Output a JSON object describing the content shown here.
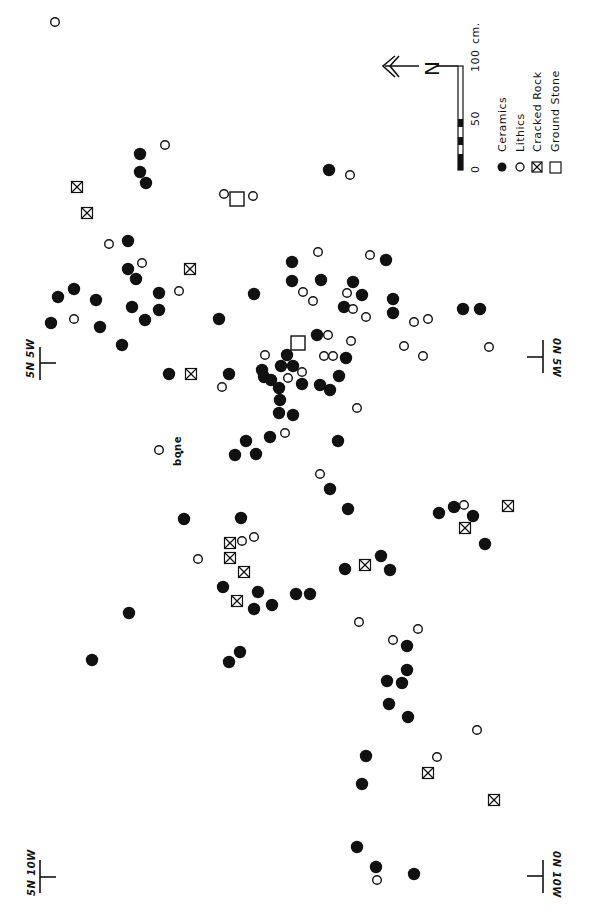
{
  "map": {
    "background": "#ffffff",
    "ink": "#111111",
    "point_radius_filled": 6.2,
    "point_radius_open": 4.3,
    "symbol_box_size": 11
  },
  "legend": {
    "items": [
      {
        "symbol": "filled-circle",
        "label": "Ceramics"
      },
      {
        "symbol": "open-circle",
        "label": "Lithics"
      },
      {
        "symbol": "boxed-x",
        "label": "Cracked Rock"
      },
      {
        "symbol": "open-square",
        "label": "Ground Stone"
      }
    ]
  },
  "scale_bar": {
    "ticks": [
      "0",
      "50",
      "100"
    ],
    "unit": "cm."
  },
  "north_arrow": {
    "label": "N",
    "icon": "north-arrow-icon"
  },
  "grid_markers": [
    {
      "label": "5N 5W",
      "position": "left-top"
    },
    {
      "label": "0N 5W",
      "position": "right-top"
    },
    {
      "label": "5N 10W",
      "position": "left-bottom"
    },
    {
      "label": "0N 10W",
      "position": "right-bottom"
    }
  ],
  "annotations": [
    {
      "label": "bone"
    }
  ],
  "artifacts": {
    "ceramics": [
      [
        140,
        154
      ],
      [
        140,
        172
      ],
      [
        146,
        183
      ],
      [
        128,
        241
      ],
      [
        128,
        269
      ],
      [
        136,
        279
      ],
      [
        254,
        294
      ],
      [
        58,
        297
      ],
      [
        74,
        289
      ],
      [
        96,
        300
      ],
      [
        132,
        307
      ],
      [
        159,
        293
      ],
      [
        159,
        310
      ],
      [
        51,
        323
      ],
      [
        100,
        327
      ],
      [
        145,
        320
      ],
      [
        219,
        319
      ],
      [
        122,
        345
      ],
      [
        329,
        170
      ],
      [
        386,
        260
      ],
      [
        292,
        262
      ],
      [
        292,
        281
      ],
      [
        321,
        280
      ],
      [
        353,
        282
      ],
      [
        362,
        295
      ],
      [
        393,
        299
      ],
      [
        344,
        307
      ],
      [
        393,
        313
      ],
      [
        463,
        309
      ],
      [
        480,
        309
      ],
      [
        317,
        335
      ],
      [
        287,
        355
      ],
      [
        346,
        358
      ],
      [
        281,
        366
      ],
      [
        293,
        366
      ],
      [
        262,
        370
      ],
      [
        264,
        377
      ],
      [
        271,
        380
      ],
      [
        169,
        374
      ],
      [
        229,
        374
      ],
      [
        302,
        384
      ],
      [
        320,
        385
      ],
      [
        330,
        390
      ],
      [
        339,
        376
      ],
      [
        279,
        388
      ],
      [
        280,
        400
      ],
      [
        279,
        413
      ],
      [
        293,
        415
      ],
      [
        246,
        441
      ],
      [
        270,
        437
      ],
      [
        235,
        455
      ],
      [
        256,
        454
      ],
      [
        338,
        441
      ],
      [
        330,
        489
      ],
      [
        348,
        509
      ],
      [
        184,
        519
      ],
      [
        241,
        518
      ],
      [
        223,
        587
      ],
      [
        258,
        592
      ],
      [
        254,
        609
      ],
      [
        272,
        605
      ],
      [
        296,
        594
      ],
      [
        310,
        594
      ],
      [
        345,
        569
      ],
      [
        381,
        556
      ],
      [
        390,
        570
      ],
      [
        439,
        513
      ],
      [
        454,
        507
      ],
      [
        473,
        516
      ],
      [
        485,
        544
      ],
      [
        129,
        613
      ],
      [
        92,
        660
      ],
      [
        240,
        652
      ],
      [
        229,
        662
      ],
      [
        407,
        646
      ],
      [
        407,
        670
      ],
      [
        387,
        681
      ],
      [
        402,
        683
      ],
      [
        389,
        704
      ],
      [
        408,
        717
      ],
      [
        366,
        756
      ],
      [
        362,
        784
      ],
      [
        357,
        847
      ],
      [
        376,
        867
      ],
      [
        414,
        874
      ]
    ],
    "lithics": [
      [
        55,
        22
      ],
      [
        165,
        145
      ],
      [
        224,
        194
      ],
      [
        253,
        196
      ],
      [
        109,
        244
      ],
      [
        142,
        263
      ],
      [
        179,
        291
      ],
      [
        74,
        319
      ],
      [
        350,
        175
      ],
      [
        318,
        252
      ],
      [
        370,
        255
      ],
      [
        303,
        292
      ],
      [
        313,
        301
      ],
      [
        347,
        293
      ],
      [
        353,
        309
      ],
      [
        366,
        317
      ],
      [
        414,
        322
      ],
      [
        428,
        319
      ],
      [
        328,
        335
      ],
      [
        351,
        341
      ],
      [
        404,
        346
      ],
      [
        423,
        356
      ],
      [
        489,
        347
      ],
      [
        265,
        355
      ],
      [
        324,
        356
      ],
      [
        333,
        356
      ],
      [
        302,
        372
      ],
      [
        288,
        378
      ],
      [
        222,
        387
      ],
      [
        357,
        408
      ],
      [
        285,
        433
      ],
      [
        159,
        450
      ],
      [
        320,
        474
      ],
      [
        242,
        541
      ],
      [
        254,
        537
      ],
      [
        198,
        559
      ],
      [
        464,
        505
      ],
      [
        359,
        622
      ],
      [
        418,
        629
      ],
      [
        393,
        640
      ],
      [
        477,
        730
      ],
      [
        437,
        757
      ],
      [
        377,
        880
      ]
    ],
    "cracked_rock": [
      [
        77,
        187
      ],
      [
        87,
        213
      ],
      [
        190,
        269
      ],
      [
        191,
        374
      ],
      [
        230,
        543
      ],
      [
        230,
        558
      ],
      [
        244,
        572
      ],
      [
        237,
        601
      ],
      [
        365,
        565
      ],
      [
        465,
        528
      ],
      [
        508,
        506
      ],
      [
        428,
        773
      ],
      [
        494,
        800
      ]
    ],
    "ground_stone": [
      [
        237,
        199
      ],
      [
        298,
        343
      ]
    ]
  }
}
